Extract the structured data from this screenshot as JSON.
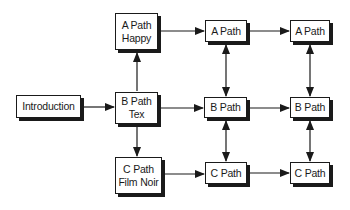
{
  "diagram": {
    "type": "flowchart",
    "colors": {
      "stroke": "#1a1a1a",
      "fill": "#ffffff",
      "background": "#ffffff"
    },
    "nodes": [
      {
        "id": "intro",
        "line1": "Introduction",
        "line2": "",
        "x": 16,
        "y": 95,
        "w": 65,
        "h": 23
      },
      {
        "id": "a1",
        "line1": "A Path",
        "line2": "Happy",
        "x": 115,
        "y": 13,
        "w": 43,
        "h": 37
      },
      {
        "id": "b1",
        "line1": "B Path",
        "line2": "Tex",
        "x": 115,
        "y": 92,
        "w": 43,
        "h": 32
      },
      {
        "id": "c1",
        "line1": "C Path",
        "line2": "Film Noir",
        "x": 115,
        "y": 157,
        "w": 47,
        "h": 37
      },
      {
        "id": "a2",
        "line1": "A Path",
        "line2": "",
        "x": 205,
        "y": 20,
        "w": 42,
        "h": 22
      },
      {
        "id": "b2",
        "line1": "B Path",
        "line2": "",
        "x": 204,
        "y": 97,
        "w": 43,
        "h": 21
      },
      {
        "id": "c2",
        "line1": "C Path",
        "line2": "",
        "x": 205,
        "y": 162,
        "w": 42,
        "h": 22
      },
      {
        "id": "a3",
        "line1": "A Path",
        "line2": "",
        "x": 290,
        "y": 20,
        "w": 40,
        "h": 22
      },
      {
        "id": "b3",
        "line1": "B Path",
        "line2": "",
        "x": 290,
        "y": 97,
        "w": 40,
        "h": 21
      },
      {
        "id": "c3",
        "line1": "C Path",
        "line2": "",
        "x": 290,
        "y": 162,
        "w": 40,
        "h": 22
      }
    ],
    "edges": [
      {
        "from": "intro",
        "to": "b1",
        "direction": "forward"
      },
      {
        "from": "b1",
        "to": "a1",
        "direction": "forward"
      },
      {
        "from": "b1",
        "to": "c1",
        "direction": "forward"
      },
      {
        "from": "a1",
        "to": "a2",
        "direction": "forward"
      },
      {
        "from": "b1",
        "to": "b2",
        "direction": "forward"
      },
      {
        "from": "c1",
        "to": "c2",
        "direction": "forward"
      },
      {
        "from": "a2",
        "to": "a3",
        "direction": "forward"
      },
      {
        "from": "b2",
        "to": "b3",
        "direction": "forward"
      },
      {
        "from": "c2",
        "to": "c3",
        "direction": "forward"
      },
      {
        "from": "a2",
        "to": "b2",
        "direction": "both"
      },
      {
        "from": "b2",
        "to": "c2",
        "direction": "both"
      },
      {
        "from": "a3",
        "to": "b3",
        "direction": "both"
      },
      {
        "from": "b3",
        "to": "c3",
        "direction": "both"
      }
    ]
  }
}
